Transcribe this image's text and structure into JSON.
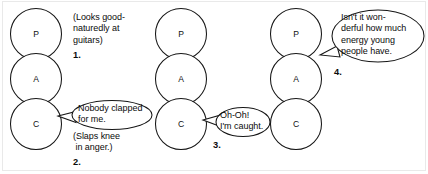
{
  "diagram": {
    "stroke_color": "#161616",
    "background_color": "#ffffff",
    "frame_color": "#e9e9e9",
    "ego_state_letters": {
      "parent": "P",
      "adult": "A",
      "child": "C"
    },
    "columns": [
      {
        "id": "column-1",
        "cx": 36,
        "states": [
          {
            "role": "parent",
            "label": "P",
            "cy": 34
          },
          {
            "role": "adult",
            "label": "A",
            "cy": 79
          },
          {
            "role": "child",
            "label": "C",
            "cy": 124
          }
        ]
      },
      {
        "id": "column-2",
        "cx": 181,
        "states": [
          {
            "role": "parent",
            "label": "P",
            "cy": 34
          },
          {
            "role": "adult",
            "label": "A",
            "cy": 79
          },
          {
            "role": "child",
            "label": "C",
            "cy": 124
          }
        ]
      },
      {
        "id": "column-3",
        "cx": 296,
        "states": [
          {
            "role": "parent",
            "label": "P",
            "cy": 34
          },
          {
            "role": "adult",
            "label": "A",
            "cy": 79
          },
          {
            "role": "child",
            "label": "C",
            "cy": 124
          }
        ]
      }
    ],
    "annotations": [
      {
        "id": "annotation-1",
        "kind": "stage-direction",
        "number": "1.",
        "lines": [
          "(Looks good-",
          "naturedly at",
          "guitars)"
        ],
        "attached_to": "column-1-parent"
      },
      {
        "id": "annotation-2",
        "kind": "speech-bubble",
        "number": "2.",
        "bubble_lines": [
          "Nobody clapped",
          "for me."
        ],
        "stage_direction_lines": [
          "(Slaps knee",
          " in anger.)"
        ],
        "attached_to": "column-1-child"
      },
      {
        "id": "annotation-3",
        "kind": "speech-bubble",
        "number": "3.",
        "bubble_lines": [
          "Oh-Oh!",
          "I'm caught."
        ],
        "attached_to": "column-2-child"
      },
      {
        "id": "annotation-4",
        "kind": "speech-bubble",
        "number": "4.",
        "bubble_lines": [
          "Isn't it won-",
          "derful how much",
          "energy young",
          "people have."
        ],
        "attached_to": "column-3-parent"
      }
    ]
  }
}
